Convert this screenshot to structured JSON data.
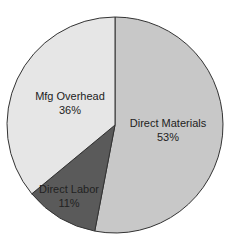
{
  "chart_data": {
    "type": "pie",
    "title": "",
    "title_cropped": true,
    "categories": [
      "Direct Materials",
      "Direct Labor",
      "Mfg Overhead"
    ],
    "values": [
      53,
      11,
      36
    ],
    "unit": "%",
    "labels": [
      {
        "name": "Direct Materials",
        "pct": "53%"
      },
      {
        "name": "Direct Labor",
        "pct": "11%"
      },
      {
        "name": "Mfg Overhead",
        "pct": "36%"
      }
    ],
    "colors": [
      "#c8c8c8",
      "#5a5a5a",
      "#e6e6e6"
    ],
    "start_angle_deg": 0,
    "direction": "clockwise",
    "legend": "none",
    "outline_color": "#333333"
  }
}
